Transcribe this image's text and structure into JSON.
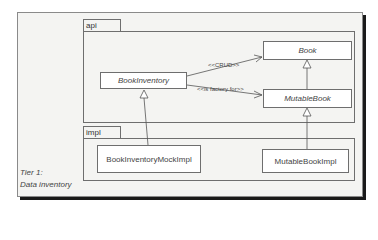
{
  "diagram": {
    "type": "uml-class-diagram",
    "packages": [
      {
        "id": "api",
        "label": "api"
      },
      {
        "id": "impl",
        "label": "impl"
      }
    ],
    "classes": [
      {
        "id": "book",
        "label": "Book",
        "package": "api",
        "abstract": true
      },
      {
        "id": "mutable_book",
        "label": "MutableBook",
        "package": "api",
        "abstract": true
      },
      {
        "id": "book_inventory",
        "label": "BookInventory",
        "package": "api",
        "abstract": true
      },
      {
        "id": "book_inventory_mock_impl",
        "label": "BookInventoryMockImpl",
        "package": "impl",
        "abstract": false
      },
      {
        "id": "mutable_book_impl",
        "label": "MutableBookImpl",
        "package": "impl",
        "abstract": false
      }
    ],
    "relations": [
      {
        "from": "book_inventory",
        "to": "book",
        "kind": "dependency",
        "label": "<<CRUD>>"
      },
      {
        "from": "book_inventory",
        "to": "mutable_book",
        "kind": "dependency",
        "label": "<<is factory for>>"
      },
      {
        "from": "mutable_book",
        "to": "book",
        "kind": "generalization",
        "label": ""
      },
      {
        "from": "mutable_book_impl",
        "to": "mutable_book",
        "kind": "realization",
        "label": ""
      },
      {
        "from": "book_inventory_mock_impl",
        "to": "book_inventory",
        "kind": "realization",
        "label": ""
      }
    ],
    "caption": {
      "line1": "Tier 1:",
      "line2": "Data inventory"
    },
    "colors": {
      "frame_bg": "#f4f4f2",
      "box_bg": "#ffffff",
      "line": "#6e6e6e",
      "shadow": "#1a1a1a"
    }
  }
}
